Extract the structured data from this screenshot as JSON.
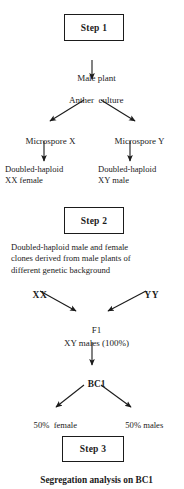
{
  "diagram": {
    "ink_color": "#1b1b1b",
    "background": "#ffffff",
    "steps": [
      {
        "id": "step1",
        "label": "Step 1"
      },
      {
        "id": "step2",
        "label": "Step 2"
      },
      {
        "id": "step3",
        "label": "Step 3"
      }
    ],
    "nodes": {
      "male_plant": "Male plant",
      "anther_culture": "Anther  culture",
      "microspore_x": "Microspore X",
      "microspore_y": "Microspore Y",
      "dh_female_line1": "Doubled-haploid",
      "dh_female_line2": "XX female",
      "dh_male_line1": "Doubled-haploid",
      "dh_male_line2": "XY male",
      "step2_desc_line1": "Doubled-haploid male and female",
      "step2_desc_line2": "clones derived from male plants of",
      "step2_desc_line3": "different genetic background",
      "parent_xx": "XX",
      "parent_yy": "YY",
      "f1_label": "F1",
      "f1_desc": "XY males (100%)",
      "bc1_label": "BC1",
      "bc1_female": "50%  female",
      "bc1_male": "50% males",
      "conclusion": "Segregation analysis on BC1"
    }
  }
}
